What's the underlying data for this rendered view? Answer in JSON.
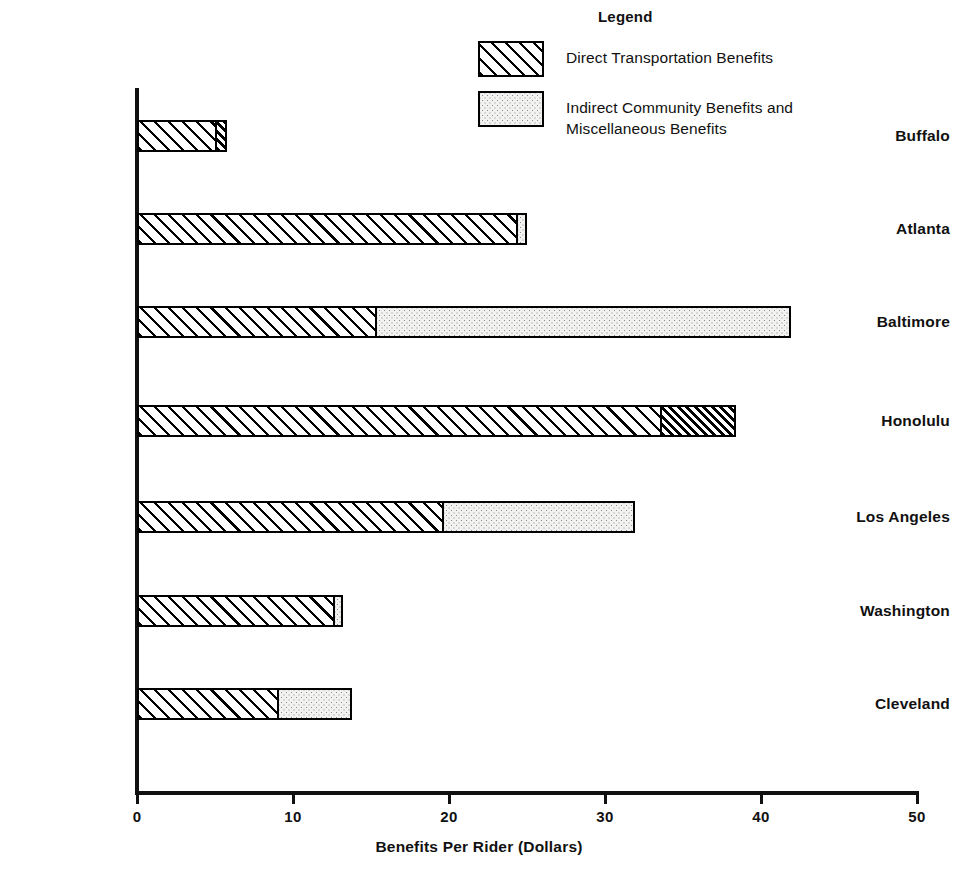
{
  "legend": {
    "title": "Legend",
    "items": [
      {
        "pattern": "hatch",
        "label": "Direct Transportation Benefits"
      },
      {
        "pattern": "dots",
        "label": "Indirect Community Benefits and\nMiscellaneous Benefits"
      }
    ]
  },
  "chart_data": {
    "type": "bar",
    "orientation": "horizontal",
    "stacked": true,
    "title": "",
    "xlabel": "Benefits Per Rider (Dollars)",
    "ylabel": "",
    "xlim": [
      0,
      50
    ],
    "xticks": [
      0,
      10,
      20,
      30,
      40,
      50
    ],
    "xtick_labels": [
      "0",
      "10",
      "20",
      "30",
      "40",
      "50"
    ],
    "grid": false,
    "legend_position": "top-right",
    "categories": [
      "Buffalo",
      "Atlanta",
      "Baltimore",
      "Honolulu",
      "Los Angeles",
      "Washington",
      "Cleveland"
    ],
    "series": [
      {
        "name": "Direct Transportation Benefits",
        "pattern": "hatch",
        "values": [
          5.1,
          24.4,
          15.2,
          33.6,
          19.6,
          12.7,
          9.0
        ]
      },
      {
        "name": "Indirect Community Benefits and Miscellaneous Benefits",
        "pattern": "dots",
        "values": [
          0.7,
          0.6,
          26.7,
          4.8,
          12.3,
          0.5,
          4.8
        ]
      }
    ],
    "totals": [
      5.8,
      25.0,
      41.9,
      38.4,
      31.9,
      13.2,
      13.8
    ]
  },
  "render": {
    "bars": [
      {
        "category": "Buffalo",
        "y": 120,
        "segments": [
          {
            "pattern": "hatch",
            "value": 5.1
          },
          {
            "pattern": "hatch-dense",
            "value": 0.7
          }
        ]
      },
      {
        "category": "Atlanta",
        "y": 213,
        "segments": [
          {
            "pattern": "hatch",
            "value": 24.4
          },
          {
            "pattern": "dots",
            "value": 0.6
          }
        ]
      },
      {
        "category": "Baltimore",
        "y": 306,
        "segments": [
          {
            "pattern": "hatch",
            "value": 15.2
          },
          {
            "pattern": "dots",
            "value": 26.7
          }
        ]
      },
      {
        "category": "Honolulu",
        "y": 405,
        "segments": [
          {
            "pattern": "hatch",
            "value": 33.6
          },
          {
            "pattern": "hatch-dense",
            "value": 4.8
          }
        ]
      },
      {
        "category": "Los Angeles",
        "y": 501,
        "segments": [
          {
            "pattern": "hatch",
            "value": 19.6
          },
          {
            "pattern": "dots",
            "value": 12.3
          }
        ]
      },
      {
        "category": "Washington",
        "y": 595,
        "segments": [
          {
            "pattern": "hatch",
            "value": 12.7
          },
          {
            "pattern": "dots",
            "value": 0.5
          }
        ]
      },
      {
        "category": "Cleveland",
        "y": 688,
        "segments": [
          {
            "pattern": "hatch",
            "value": 9.0
          },
          {
            "pattern": "dots",
            "value": 4.8
          }
        ]
      }
    ],
    "x0_px": 137,
    "px_per_unit": 15.6,
    "bar_height_px": 32
  }
}
